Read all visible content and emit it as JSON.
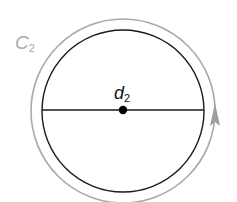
{
  "diagram": {
    "curve_label": {
      "main": "C",
      "subscript": "2"
    },
    "center_label": {
      "main": "d",
      "subscript": "2"
    },
    "colors": {
      "curve": "#a9a9a9",
      "circle": "#1a1a1a",
      "diameter": "#1a1a1a",
      "center_point": "#000000",
      "arrow": "#9e9e9e",
      "background": "#ffffff"
    },
    "shapes": {
      "outer_curve": {
        "cx": 123,
        "cy": 111,
        "r": 92,
        "direction": "counterclockwise"
      },
      "inner_circle": {
        "cx": 123,
        "cy": 111,
        "r": 81
      },
      "diameter": {
        "x1": 42,
        "y1": 110,
        "x2": 204,
        "y2": 110
      },
      "center_point": {
        "cx": 123,
        "cy": 110,
        "r": 4
      }
    }
  }
}
